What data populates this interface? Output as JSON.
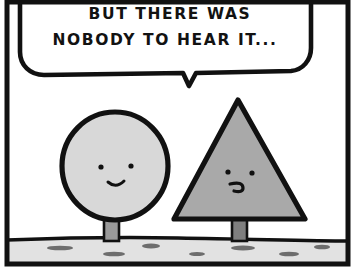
{
  "panel": {
    "name": "comic-panel",
    "width": 356,
    "height": 269,
    "background_color": "#ffffff",
    "border_color": "#111111",
    "border_thickness": 4
  },
  "speech_bubble": {
    "name": "speech-bubble",
    "shape": "rounded-rectangle-with-tail",
    "fill_color": "#ffffff",
    "stroke_color": "#111111",
    "tail_direction": "down",
    "tail_points_to": "triangle-character",
    "lines": [
      "BUT THERE WAS",
      "NOBODY TO HEAR IT..."
    ],
    "full_text": "BUT THERE WAS NOBODY TO HEAR IT..."
  },
  "characters": [
    {
      "name": "circle-character",
      "shape": "circle",
      "fill_color": "#d8d8d8",
      "outline_color": "#111111",
      "expression": "smile",
      "eyes": 2,
      "mouth": "small-curved-smile",
      "stem_color": "#9a9a9a",
      "position": "left"
    },
    {
      "name": "triangle-character",
      "shape": "triangle",
      "fill_color": "#a9a9a9",
      "outline_color": "#111111",
      "expression": "squiggle",
      "eyes": 2,
      "mouth": "small-hook-squiggle",
      "stem_color": "#7f7f7f",
      "position": "right"
    }
  ],
  "ground": {
    "name": "ground-strip",
    "fill_color": "#e2e2e2",
    "line_color": "#111111",
    "pebble_color": "#6d6d6d",
    "pebbles": [
      {
        "x": 48,
        "y": 246,
        "w": 25,
        "h": 4
      },
      {
        "x": 103,
        "y": 252,
        "w": 22,
        "h": 4
      },
      {
        "x": 143,
        "y": 244,
        "w": 17,
        "h": 5
      },
      {
        "x": 190,
        "y": 252,
        "w": 14,
        "h": 4
      },
      {
        "x": 231,
        "y": 246,
        "w": 24,
        "h": 5
      },
      {
        "x": 279,
        "y": 252,
        "w": 20,
        "h": 4
      },
      {
        "x": 315,
        "y": 246,
        "w": 15,
        "h": 4
      }
    ]
  }
}
